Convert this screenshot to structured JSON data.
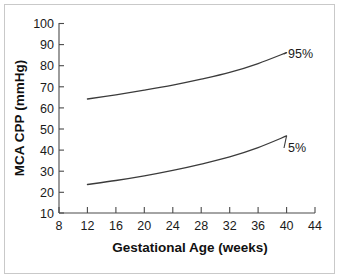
{
  "chart_data": {
    "type": "line",
    "title": "",
    "xlabel": "Gestational Age (weeks)",
    "ylabel": "MCA CPP (mmHg)",
    "xlim": [
      8,
      44
    ],
    "ylim": [
      10,
      100
    ],
    "xticks": [
      8,
      12,
      16,
      20,
      24,
      28,
      32,
      36,
      40,
      44
    ],
    "yticks": [
      10,
      20,
      30,
      40,
      50,
      60,
      70,
      80,
      90,
      100
    ],
    "grid": false,
    "legend_position": "inline-right-of-curve",
    "x": [
      12,
      16,
      20,
      24,
      28,
      32,
      36,
      40
    ],
    "series": [
      {
        "name": "95%",
        "label": "95%",
        "values": [
          64.0,
          66.0,
          68.2,
          70.6,
          73.4,
          76.6,
          80.8,
          86.0
        ]
      },
      {
        "name": "5%",
        "label": "5%",
        "values": [
          23.5,
          25.4,
          27.6,
          30.2,
          33.2,
          36.6,
          41.0,
          46.5
        ]
      }
    ],
    "colors": {
      "curve": "#3b3b3b",
      "axis": "#4a4a4a",
      "text": "#1a1a1a",
      "background": "#ffffff",
      "border": "#c9c9c9"
    }
  },
  "axes": {
    "x_tick_labels": [
      "8",
      "12",
      "16",
      "20",
      "24",
      "28",
      "32",
      "36",
      "40",
      "44"
    ],
    "y_tick_labels": [
      "10",
      "20",
      "30",
      "40",
      "50",
      "60",
      "70",
      "80",
      "90",
      "100"
    ],
    "x_axis_title": "Gestational Age (weeks)",
    "y_axis_title": "MCA CPP (mmHg)"
  },
  "annotations": {
    "upper_curve_label": "95%",
    "lower_curve_label": "5%"
  }
}
